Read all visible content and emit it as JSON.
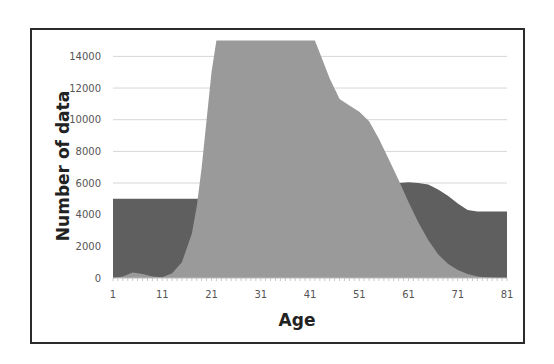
{
  "chart_data": {
    "type": "area",
    "title": "",
    "xlabel": "Age",
    "ylabel": "Number of data",
    "xlim": [
      1,
      81
    ],
    "ylim": [
      0,
      15000
    ],
    "x_ticks": [
      1,
      11,
      21,
      31,
      41,
      51,
      61,
      71,
      81
    ],
    "y_ticks": [
      0,
      2000,
      4000,
      6000,
      8000,
      10000,
      12000,
      14000
    ],
    "grid": {
      "horizontal": true,
      "vertical": false
    },
    "legend": null,
    "x": [
      1,
      3,
      5,
      7,
      9,
      11,
      13,
      15,
      17,
      18,
      19,
      20,
      21,
      22,
      25,
      30,
      35,
      40,
      42,
      43,
      45,
      47,
      49,
      51,
      53,
      55,
      57,
      59,
      61,
      63,
      65,
      67,
      69,
      71,
      73,
      75,
      77,
      79,
      81
    ],
    "series": [
      {
        "name": "Series 1 (dark)",
        "color": "#5f5f5f",
        "values": [
          5000,
          5000,
          5000,
          5000,
          5000,
          5000,
          5000,
          5000,
          5000,
          5000,
          5000,
          5000,
          5000,
          5000,
          5000,
          5000,
          5000,
          5000,
          5000,
          5000,
          5000,
          5000,
          5000,
          5000,
          5000,
          5000,
          5500,
          6000,
          6050,
          6000,
          5900,
          5600,
          5200,
          4700,
          4300,
          4200,
          4200,
          4200,
          4200
        ]
      },
      {
        "name": "Series 2 (light)",
        "color": "#9a9a9a",
        "values": [
          0,
          100,
          350,
          250,
          100,
          50,
          300,
          1000,
          2800,
          4500,
          7000,
          10000,
          13000,
          15000,
          15000,
          15000,
          15000,
          15000,
          15000,
          14200,
          12600,
          11300,
          10900,
          10500,
          9900,
          8800,
          7500,
          6200,
          4800,
          3500,
          2400,
          1500,
          900,
          500,
          250,
          100,
          30,
          0,
          0
        ]
      }
    ]
  },
  "axes": {
    "x_title": "Age",
    "y_title": "Number of data",
    "x_tick_labels": [
      "1",
      "11",
      "21",
      "31",
      "41",
      "51",
      "61",
      "71",
      "81"
    ],
    "y_tick_labels": [
      "0",
      "2000",
      "4000",
      "6000",
      "8000",
      "10000",
      "12000",
      "14000"
    ]
  }
}
